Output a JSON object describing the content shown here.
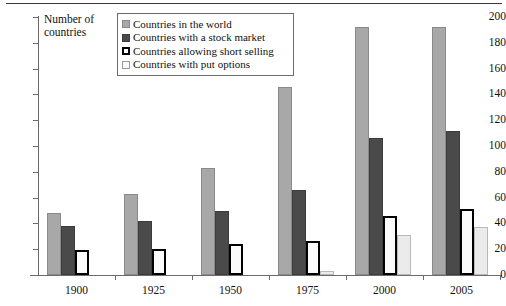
{
  "chart_data": {
    "type": "bar",
    "title": "",
    "xlabel": "",
    "ylabel": "Number of countries",
    "ylim": [
      0,
      200
    ],
    "ytick_step": 20,
    "yticks": [
      200,
      180,
      160,
      140,
      120,
      100,
      80,
      60,
      40,
      20,
      0
    ],
    "grid": false,
    "legend_position": "top-center",
    "categories": [
      "1900",
      "1925",
      "1950",
      "1975",
      "2000",
      "2005"
    ],
    "series": [
      {
        "name": "Countries in the world",
        "color": "#a8a8a8",
        "values": [
          48,
          63,
          83,
          146,
          192,
          192
        ]
      },
      {
        "name": "Countries with a stock market",
        "color": "#4a4a4a",
        "values": [
          38,
          42,
          50,
          66,
          106,
          112
        ]
      },
      {
        "name": "Countries allowing short selling",
        "color": "#ffffff",
        "values": [
          19,
          20,
          24,
          26,
          46,
          51
        ]
      },
      {
        "name": "Countries with put options",
        "color": "#ebebeb",
        "values": [
          0,
          0,
          0,
          3,
          31,
          37
        ]
      }
    ]
  },
  "axis": {
    "y_title": "Number of countries"
  },
  "legend": {
    "items": [
      {
        "label": "Countries in the world",
        "swatch": "light-gray-swatch"
      },
      {
        "label": "Countries with a stock market",
        "swatch": "dark-gray-swatch"
      },
      {
        "label": "Countries allowing short selling",
        "swatch": "black-outline-swatch"
      },
      {
        "label": "Countries with put options",
        "swatch": "pale-outline-swatch"
      }
    ]
  }
}
